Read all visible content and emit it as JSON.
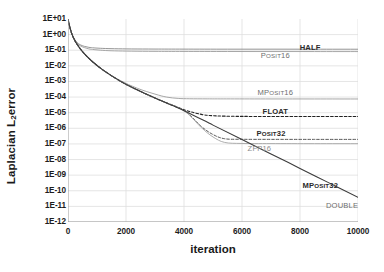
{
  "chart_data": {
    "type": "line",
    "title": "",
    "xlabel": "iteration",
    "ylabel": "Laplacian L2 error",
    "ylabel_main": "Laplacian L",
    "ylabel_sub": "2",
    "ylabel_tail": " error",
    "xlim": [
      0,
      10000
    ],
    "ylim": [
      1e-12,
      10
    ],
    "yscale": "log",
    "xscale": "linear",
    "grid": true,
    "legend_position": "inline-right-of-curve",
    "xticks": [
      0,
      2000,
      4000,
      6000,
      8000,
      10000
    ],
    "xtick_labels": [
      "0",
      "2000",
      "4000",
      "6000",
      "8000",
      "10000"
    ],
    "yticks": [
      10,
      1,
      0.1,
      0.01,
      0.001,
      0.0001,
      1e-05,
      1e-06,
      1e-07,
      1e-08,
      1e-09,
      1e-10,
      1e-11,
      1e-12
    ],
    "ytick_labels": [
      "1E+01",
      "1E+00",
      "1E-01",
      "1E-02",
      "1E-03",
      "1E-04",
      "1E-05",
      "1E-06",
      "1E-07",
      "1E-08",
      "1E-09",
      "1E-10",
      "1E-11",
      "1E-12"
    ],
    "series": [
      {
        "name": "HALF",
        "label": "HALF",
        "label_caps": "HALF",
        "label_small": "",
        "color": "#8a8a8a",
        "style": "solid",
        "width": 0.9,
        "label_x": 8350,
        "label_y": 0.16,
        "label_class": "lbl-dark",
        "floor": 0.115,
        "x": [
          0,
          60,
          120,
          200,
          300,
          420,
          560,
          720,
          900,
          1200,
          1600,
          2200,
          3000,
          4000,
          5500,
          7000,
          8500,
          10000
        ],
        "y": [
          10,
          3.2,
          1.35,
          0.62,
          0.33,
          0.225,
          0.178,
          0.153,
          0.141,
          0.131,
          0.125,
          0.121,
          0.119,
          0.118,
          0.117,
          0.117,
          0.1165,
          0.116
        ]
      },
      {
        "name": "Posit16",
        "label": "Posit16",
        "label_caps": "P",
        "label_small": "OSIT",
        "label_tail": "16",
        "color": "#9d9d9d",
        "style": "solid",
        "width": 0.9,
        "label_x": 7150,
        "label_y": 0.048,
        "label_class": "lbl-mid",
        "floor": 0.082,
        "x": [
          0,
          60,
          120,
          200,
          300,
          420,
          560,
          720,
          900,
          1200,
          1600,
          2200,
          3000,
          4000,
          5500,
          7000,
          8500,
          10000
        ],
        "y": [
          10,
          3.2,
          1.3,
          0.58,
          0.295,
          0.195,
          0.148,
          0.122,
          0.11,
          0.098,
          0.091,
          0.087,
          0.0845,
          0.0835,
          0.0828,
          0.0825,
          0.0822,
          0.082
        ]
      },
      {
        "name": "MPosit16",
        "label": "MPosit16",
        "label_caps": "MP",
        "label_small": "OSIT",
        "label_tail": "16",
        "color": "#9d9d9d",
        "style": "solid",
        "width": 0.9,
        "label_x": 7150,
        "label_y": 0.00022,
        "label_class": "lbl-mid",
        "floor": 0.00011,
        "x": [
          0,
          60,
          120,
          200,
          300,
          500,
          800,
          1200,
          1800,
          2400,
          3000,
          3400,
          3800,
          4200,
          4800,
          5600,
          7000,
          8500,
          10000
        ],
        "y": [
          10,
          3.2,
          1.3,
          0.56,
          0.26,
          0.082,
          0.022,
          0.0055,
          0.00115,
          0.00036,
          0.000155,
          0.0001,
          8.2e-05,
          7.8e-05,
          7.7e-05,
          7.65e-05,
          7.6e-05,
          7.58e-05,
          7.55e-05
        ]
      },
      {
        "name": "FLOAT",
        "label": "FLOAT",
        "label_caps": "FLOAT",
        "label_small": "",
        "color": "#222222",
        "style": "dashed",
        "width": 1.1,
        "label_x": 7150,
        "label_y": 1.35e-05,
        "label_class": "lbl-dark",
        "floor": 6.2e-06,
        "x": [
          0,
          60,
          120,
          200,
          300,
          500,
          800,
          1200,
          1800,
          2400,
          3200,
          4000,
          4600,
          5000,
          5400,
          6000,
          7000,
          8500,
          10000
        ],
        "y": [
          10,
          3.2,
          1.3,
          0.56,
          0.26,
          0.082,
          0.022,
          0.0055,
          0.00105,
          0.00028,
          6e-05,
          1.55e-05,
          7.8e-06,
          6.4e-06,
          6e-06,
          5.8e-06,
          5.7e-06,
          5.7e-06,
          5.7e-06
        ]
      },
      {
        "name": "Posit32",
        "label": "Posit32",
        "label_caps": "P",
        "label_small": "OSIT",
        "label_tail": "32",
        "color": "#444444",
        "style": "dashed",
        "width": 0.9,
        "label_x": 7000,
        "label_y": 4.8e-07,
        "label_class": "lbl-dark",
        "floor": 1.95e-07,
        "x": [
          0,
          60,
          120,
          200,
          300,
          500,
          800,
          1200,
          1800,
          2400,
          3200,
          4000,
          4600,
          5000,
          5400,
          6000,
          7000,
          8500,
          10000
        ],
        "y": [
          10,
          3.2,
          1.3,
          0.56,
          0.26,
          0.082,
          0.022,
          0.0055,
          0.00105,
          0.00028,
          6e-05,
          1.4e-05,
          1.3e-06,
          4e-07,
          2.15e-07,
          1.98e-07,
          1.96e-07,
          1.95e-07,
          1.95e-07
        ]
      },
      {
        "name": "ZFP16",
        "label": "ZFP16",
        "label_caps": "ZFP",
        "label_small": "",
        "label_tail": "16",
        "color": "#a5a5a5",
        "style": "solid",
        "width": 0.9,
        "label_x": 6600,
        "label_y": 5.2e-08,
        "label_class": "lbl-gray",
        "floor": 1.05e-07,
        "x": [
          0,
          60,
          120,
          200,
          300,
          500,
          800,
          1200,
          1800,
          2400,
          3200,
          4000,
          4600,
          5000,
          5400,
          6000,
          7000,
          8500,
          10000
        ],
        "y": [
          10,
          3.2,
          1.3,
          0.56,
          0.26,
          0.082,
          0.022,
          0.0055,
          0.00105,
          0.00028,
          6e-05,
          1.35e-05,
          1.1e-06,
          2.8e-07,
          1.25e-07,
          1.07e-07,
          1.05e-07,
          1.04e-07,
          1.04e-07
        ]
      },
      {
        "name": "MPosit32",
        "label": "MPosit32",
        "label_caps": "MP",
        "label_small": "OSIT",
        "label_tail": "32",
        "color": "#3a3a3a",
        "style": "solid",
        "width": 1.1,
        "label_x": 8700,
        "label_y": 2.2e-10,
        "label_class": "lbl-dark",
        "floor": 0,
        "x": [
          0,
          60,
          120,
          200,
          300,
          500,
          800,
          1200,
          1800,
          2400,
          3200,
          4000,
          5000,
          6000,
          7000,
          8000,
          9000,
          10000
        ],
        "y": [
          10,
          3.2,
          1.3,
          0.56,
          0.26,
          0.082,
          0.022,
          0.0055,
          0.00105,
          0.00028,
          6e-05,
          1.35e-05,
          1.6e-06,
          1.9e-07,
          2.3e-08,
          2.7e-09,
          3.2e-10,
          3.8e-11
        ]
      },
      {
        "name": "DOUBLE",
        "label": "DOUBLE",
        "label_caps": "DOUBLE",
        "label_small": "",
        "color": "#3a3a3a",
        "style": "solid",
        "width": 1.1,
        "label_x": 9450,
        "label_y": 1.3e-11,
        "label_class": "lbl-mid",
        "floor": 0,
        "x": [],
        "y": []
      }
    ]
  }
}
